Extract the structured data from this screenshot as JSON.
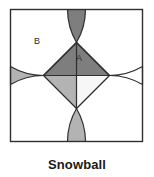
{
  "figure": {
    "caption": "Snowball",
    "frame": {
      "x": 10.5,
      "y": 9.5,
      "size": 132,
      "stroke": "#2f2f2f",
      "stroke_width": 1.4,
      "fill": "#ffffff"
    },
    "labels": [
      {
        "id": "A",
        "text": "A",
        "x": 79,
        "y": 59
      },
      {
        "id": "B",
        "text": "B",
        "x": 37,
        "y": 42
      }
    ],
    "colors": {
      "background": "#ffffff",
      "outline": "#2f2f2f",
      "dark_gray": "#7e7e7e",
      "medium_gray": "#b3b3b3",
      "light_white": "#f7f7f7",
      "corner_white": "#ffffff",
      "caption_text": "#1a1a1a",
      "label_text": "#2b2b2b"
    },
    "geometry": {
      "description": "Square frame with four quarter-circle arcs centered at the square corners, forming a four-pointed snowball star; central diamond split into four triangles.",
      "square_side": 132,
      "arc_radius": 66,
      "center": {
        "x": 76.5,
        "y": 75.5
      },
      "diamond_half_diagonal": 33
    },
    "regions": [
      {
        "name": "top-arm",
        "shade": "dark_gray"
      },
      {
        "name": "left-arm",
        "shade": "medium_gray"
      },
      {
        "name": "bottom-arm",
        "shade": "medium_gray"
      },
      {
        "name": "right-arm",
        "shade": "corner_white"
      },
      {
        "name": "center-top-triangle",
        "shade": "dark_gray",
        "label": "A"
      },
      {
        "name": "center-left-triangle",
        "shade": "medium_gray"
      },
      {
        "name": "center-bottom-triangle",
        "shade": "medium_gray"
      },
      {
        "name": "center-right-triangle",
        "shade": "light_white"
      },
      {
        "name": "corner-top-left",
        "shade": "corner_white",
        "label": "B"
      },
      {
        "name": "corner-top-right",
        "shade": "corner_white"
      },
      {
        "name": "corner-bottom-left",
        "shade": "corner_white"
      },
      {
        "name": "corner-bottom-right",
        "shade": "corner_white"
      }
    ]
  }
}
